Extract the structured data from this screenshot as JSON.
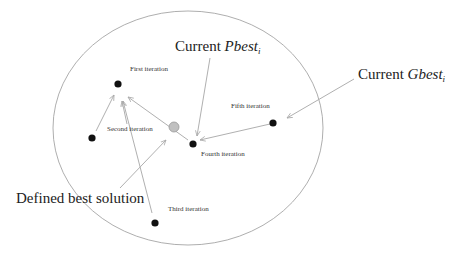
{
  "diagram": {
    "boundary": {
      "cx": 188,
      "cy": 128,
      "rx": 135,
      "ry": 117,
      "stroke": "#999999"
    },
    "points": [
      {
        "id": "first",
        "label": "First iteration",
        "x": 118,
        "y": 84,
        "lx": 130,
        "ly": 71,
        "color": "#111111"
      },
      {
        "id": "second",
        "label": "Second iteration",
        "x": 92,
        "y": 138,
        "lx": 107,
        "ly": 131,
        "color": "#111111"
      },
      {
        "id": "third",
        "label": "Third iteration",
        "x": 155,
        "y": 223,
        "lx": 168,
        "ly": 211,
        "color": "#111111"
      },
      {
        "id": "fourth",
        "label": "Fourth iteration",
        "x": 193,
        "y": 144,
        "lx": 201,
        "ly": 156,
        "color": "#111111"
      },
      {
        "id": "fifth",
        "label": "Fifth iteration",
        "x": 273,
        "y": 123,
        "lx": 231,
        "ly": 108,
        "color": "#111111"
      }
    ],
    "best_point": {
      "x": 174,
      "y": 127,
      "color": "#bbbbbb"
    },
    "callouts": {
      "pbest": {
        "prefix": "Current ",
        "symbol": "Pbest",
        "subscript": "i",
        "x": 175,
        "y": 51
      },
      "gbest": {
        "prefix": "Current ",
        "symbol": "Gbest",
        "subscript": "i",
        "x": 358,
        "y": 79
      },
      "defined": {
        "text": "Defined best solution",
        "x": 16,
        "y": 203
      }
    },
    "arrow_color": "#b0b0b0"
  }
}
